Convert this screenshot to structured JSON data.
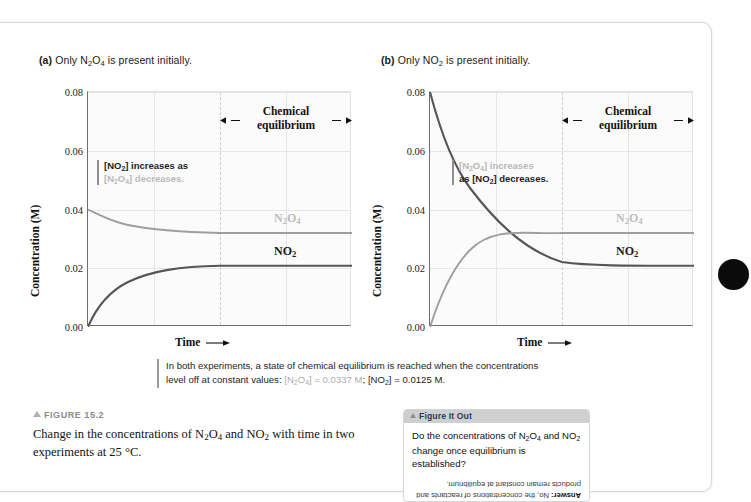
{
  "figure": {
    "marker_label": "FIGURE 15.2",
    "caption": "Change in the concentrations of N2O4 and NO2 with time in two experiments at 25 °C."
  },
  "panels": [
    {
      "key": "a",
      "tag": "(a)",
      "title": "Only N2O4 is present initially.",
      "equilibrium_label_line1": "Chemical",
      "equilibrium_label_line2": "equilibrium",
      "callout_strong": "[NO2] increases as",
      "callout_faded": "[N2O4] decreases.",
      "label_n2o4": "N2O4",
      "label_no2": "NO2"
    },
    {
      "key": "b",
      "tag": "(b)",
      "title": "Only NO2 is present initially.",
      "equilibrium_label_line1": "Chemical",
      "equilibrium_label_line2": "equilibrium",
      "callout_strong": "as [NO2] decreases.",
      "callout_faded": "[N2O4] increases",
      "label_n2o4": "N2O4",
      "label_no2": "NO2"
    }
  ],
  "axes": {
    "y_label": "Concentration (M)",
    "x_label": "Time",
    "y_ticks": [
      "0.08",
      "0.06",
      "0.04",
      "0.02",
      "0.00"
    ]
  },
  "note": {
    "line1": "In both experiments, a state of chemical equilibrium is reached when the concentrations",
    "line2_pre": "level off at constant values: ",
    "line2_grey": "[N2O4] = 0.0337 M",
    "line2_mid": "; ",
    "line2_dark": "[NO2] = 0.0125 M.",
    "grey_color": "#adadad"
  },
  "figure_it_out": {
    "header": "Figure It Out",
    "question_line1": "Do the concentrations of N2O4 and NO2",
    "question_line2": "change once equilibrium is established?",
    "answer_prefix": "Answer:",
    "answer_body": " No, the concentrations of reactants and products remain constant at equilibrium."
  },
  "colors": {
    "n2o4_curve": "#9e9e9e",
    "no2_curve": "#565656",
    "plot_bg": "#fbfbfb",
    "grid": "#e6e6e6",
    "axis": "#6f6f6f",
    "page_bg": "#ffffff",
    "fio_header_bg": "#cfcfcf",
    "fio_header_text": "#1c3f6e",
    "edge_dot": "#0b0b0b"
  },
  "chart_data": {
    "type": "line",
    "title": "Change in the concentrations of N2O4 and NO2 with time in two experiments at 25 °C",
    "xlabel": "Time",
    "ylabel": "Concentration (M)",
    "ylim": [
      0.0,
      0.08
    ],
    "ytick_values": [
      0.0,
      0.02,
      0.04,
      0.06,
      0.08
    ],
    "grid": true,
    "legend_position": "inline-right",
    "equilibrium_concentrations": {
      "N2O4": 0.0337,
      "NO2": 0.0125,
      "units": "M",
      "temperature": "25 °C"
    },
    "panels": [
      {
        "key": "a",
        "label": "(a) Only N2O4 is present initially.",
        "x": [
          0,
          0.05,
          0.1,
          0.15,
          0.2,
          0.25,
          0.3,
          0.35,
          0.4,
          0.5,
          0.6,
          0.7,
          0.8,
          0.9,
          1.0
        ],
        "series": [
          {
            "name": "N2O4",
            "color": "#9e9e9e",
            "initial": 0.04,
            "final": 0.0337,
            "values": [
              0.04,
              0.0381,
              0.0367,
              0.0357,
              0.0351,
              0.0346,
              0.0343,
              0.0341,
              0.034,
              0.0338,
              0.0337,
              0.0337,
              0.0337,
              0.0337,
              0.0337
            ]
          },
          {
            "name": "NO2",
            "color": "#565656",
            "initial": 0.0,
            "final": 0.0125,
            "values": [
              0.0,
              0.0038,
              0.0066,
              0.0086,
              0.0099,
              0.0108,
              0.0114,
              0.0118,
              0.012,
              0.0123,
              0.0125,
              0.0125,
              0.0125,
              0.0125,
              0.0125
            ]
          }
        ]
      },
      {
        "key": "b",
        "label": "(b) Only NO2 is present initially.",
        "x": [
          0,
          0.05,
          0.1,
          0.15,
          0.2,
          0.25,
          0.3,
          0.35,
          0.4,
          0.5,
          0.6,
          0.7,
          0.8,
          0.9,
          1.0
        ],
        "series": [
          {
            "name": "NO2",
            "color": "#565656",
            "initial": 0.08,
            "final": 0.0125,
            "values": [
              0.08,
              0.059,
              0.044,
              0.034,
              0.0265,
              0.0215,
              0.018,
              0.0158,
              0.0145,
              0.0132,
              0.0127,
              0.0125,
              0.0125,
              0.0125,
              0.0125
            ]
          },
          {
            "name": "N2O4",
            "color": "#9e9e9e",
            "initial": 0.0,
            "final": 0.0337,
            "values": [
              0.0,
              0.0105,
              0.018,
              0.0232,
              0.0268,
              0.0292,
              0.0308,
              0.0319,
              0.0326,
              0.0332,
              0.0335,
              0.0337,
              0.0337,
              0.0337,
              0.0337
            ]
          }
        ]
      }
    ]
  }
}
